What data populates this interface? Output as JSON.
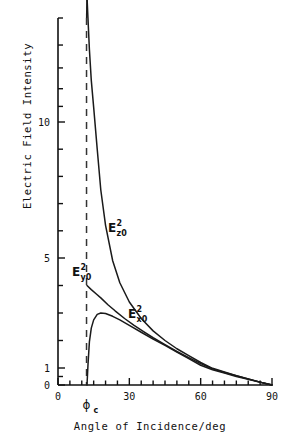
{
  "chart_data": {
    "type": "line",
    "title": "",
    "xlabel": "Angle of Incidence/deg",
    "ylabel": "Electric Field Intensity",
    "xlim": [
      0,
      90
    ],
    "ylim": [
      0,
      20
    ],
    "grid": false,
    "legend_position": "inline-annotations",
    "xticks": [
      0,
      30,
      60,
      90
    ],
    "xtick_labels": [
      "0",
      "30",
      "60",
      "90"
    ],
    "yticks": [
      0,
      1,
      5,
      10
    ],
    "ytick_labels": [
      "0",
      "1",
      "5",
      "10"
    ],
    "y_scale_note": "non-linear (compressed toward high values)",
    "critical_angle_deg": 12,
    "critical_angle_label": "ϕ",
    "critical_angle_sub": "c",
    "series": [
      {
        "name": "E_z0^2",
        "label_main": "E",
        "label_sup": "2",
        "label_sub": "z0",
        "x": [
          12.2,
          12.6,
          13.2,
          14,
          15,
          16.5,
          18,
          20,
          23,
          26,
          30,
          35,
          40,
          45,
          50,
          55,
          60,
          65,
          70,
          75,
          80,
          85,
          90
        ],
        "y": [
          22,
          20,
          17,
          14,
          11.4,
          9.0,
          7.5,
          6.2,
          4.9,
          4.1,
          3.4,
          2.8,
          2.35,
          2.0,
          1.7,
          1.45,
          1.2,
          0.98,
          0.76,
          0.55,
          0.36,
          0.17,
          0
        ]
      },
      {
        "name": "E_y0^2",
        "label_main": "E",
        "label_sup": "2",
        "label_sub": "y0",
        "x": [
          12.2,
          14,
          16,
          18,
          21,
          24,
          28,
          32,
          36,
          40,
          45,
          50,
          55,
          60,
          65,
          70,
          75,
          80,
          85,
          90
        ],
        "y": [
          4.0,
          3.85,
          3.7,
          3.55,
          3.3,
          3.08,
          2.8,
          2.55,
          2.32,
          2.1,
          1.85,
          1.6,
          1.38,
          1.16,
          0.95,
          0.74,
          0.54,
          0.35,
          0.17,
          0
        ]
      },
      {
        "name": "E_x0^2",
        "label_main": "E",
        "label_sup": "2",
        "label_sub": "x0",
        "x": [
          12.2,
          12.6,
          13.2,
          14,
          15,
          16.5,
          18,
          20,
          23,
          26,
          30,
          35,
          40,
          45,
          50,
          55,
          60,
          65,
          70,
          75,
          80,
          85,
          90
        ],
        "y": [
          0,
          1.1,
          1.95,
          2.45,
          2.75,
          2.95,
          3.0,
          2.98,
          2.88,
          2.75,
          2.55,
          2.3,
          2.05,
          1.82,
          1.58,
          1.34,
          1.1,
          0.9,
          0.7,
          0.5,
          0.33,
          0.16,
          0
        ]
      }
    ]
  },
  "colors": {
    "axis": "#111111",
    "curve": "#1a1a1a",
    "critical_line": "#333333",
    "background": "#ffffff"
  }
}
